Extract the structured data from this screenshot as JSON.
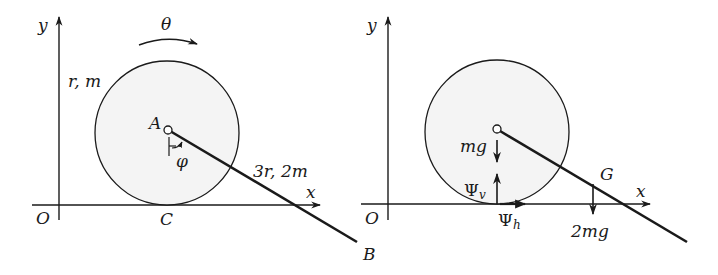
{
  "colors": {
    "ink": "#1a1a1a",
    "disk_fill": "#f4f4f4",
    "background": "#ffffff"
  },
  "left_figure": {
    "axis_y_label": "y",
    "axis_x_label": "x",
    "origin_label": "O",
    "rotation_label": "θ",
    "disk_label": "r, m",
    "pin_label": "A",
    "angle_label": "φ",
    "rod_label": "3r, 2m",
    "contact_label": "C",
    "rod_end_label": "B"
  },
  "right_figure": {
    "axis_y_label": "y",
    "axis_x_label": "x",
    "origin_label": "O",
    "disk_weight_label": "mg",
    "normal_force_label": "Ψ",
    "normal_force_sub": "v",
    "friction_force_label": "Ψ",
    "friction_force_sub": "h",
    "rod_cg_label": "G",
    "rod_weight_label": "2mg"
  }
}
